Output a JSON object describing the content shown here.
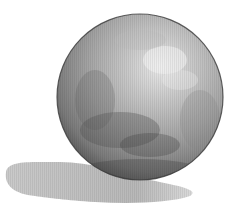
{
  "image": {
    "subject": "watercolor sphere with cast shadow",
    "background_color": "#ffffff",
    "sphere": {
      "center_x": 140,
      "center_y": 97,
      "radius": 83,
      "highlight_color": "#e6e6e6",
      "midtone_color": "#a8a8a8",
      "shadow_color": "#555555",
      "edge_color": "#3a3a3a"
    },
    "cast_shadow": {
      "color": "#b8b8b8",
      "direction": "lower-left"
    }
  }
}
